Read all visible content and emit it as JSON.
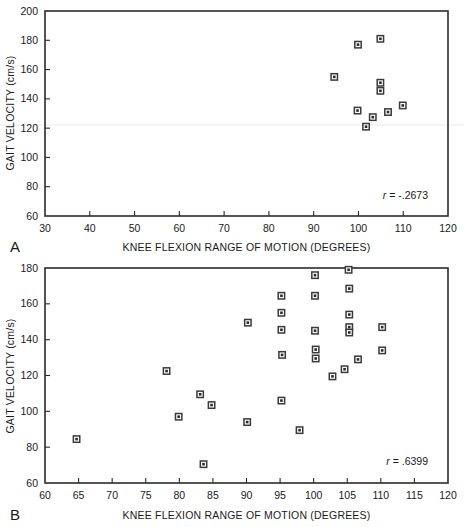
{
  "figure": {
    "caption_letters": {
      "a": "A",
      "b": "B"
    }
  },
  "chart_data": [
    {
      "id": "panel-a",
      "type": "scatter",
      "panel_label": "A",
      "title": "",
      "xlabel": "KNEE FLEXION RANGE OF MOTION (DEGREES)",
      "ylabel": "GAIT VELOCITY (cm/s)",
      "xlim": [
        30,
        120
      ],
      "ylim": [
        60,
        200
      ],
      "xticks": [
        30,
        40,
        50,
        60,
        70,
        80,
        90,
        100,
        110,
        120
      ],
      "yticks": [
        60,
        80,
        100,
        120,
        140,
        160,
        180,
        200
      ],
      "xticklabels": [
        "30",
        "40",
        "50",
        "60",
        "70",
        "80",
        "90",
        "100",
        "110",
        "120"
      ],
      "yticklabels": [
        "60",
        "80",
        "100",
        "120",
        "140",
        "160",
        "180",
        "200"
      ],
      "grid": false,
      "legend": "none",
      "annotation": "r = -.2673",
      "annotation_r_symbol": "r",
      "annotation_r_value": "= -.2673",
      "marker": "square-with-center-dot",
      "points": [
        {
          "x": 94.6,
          "y": 155
        },
        {
          "x": 99.9,
          "y": 177
        },
        {
          "x": 104.9,
          "y": 181
        },
        {
          "x": 99.8,
          "y": 132
        },
        {
          "x": 101.7,
          "y": 121
        },
        {
          "x": 103.2,
          "y": 127.5
        },
        {
          "x": 104.9,
          "y": 151
        },
        {
          "x": 104.9,
          "y": 145.5
        },
        {
          "x": 106.6,
          "y": 131
        },
        {
          "x": 109.9,
          "y": 135.5
        }
      ]
    },
    {
      "id": "panel-b",
      "type": "scatter",
      "panel_label": "B",
      "title": "",
      "xlabel": "KNEE FLEXION RANGE OF MOTION (DEGREES)",
      "ylabel": "GAIT VELOCITY (cm/s)",
      "xlim": [
        60,
        120
      ],
      "ylim": [
        60,
        180
      ],
      "xticks": [
        60,
        65,
        70,
        75,
        80,
        85,
        90,
        95,
        100,
        105,
        110,
        115,
        120
      ],
      "yticks": [
        60,
        80,
        100,
        120,
        140,
        160,
        180
      ],
      "xticklabels": [
        "60",
        "65",
        "70",
        "75",
        "80",
        "85",
        "90",
        "95",
        "100",
        "105",
        "110",
        "115",
        "120"
      ],
      "yticklabels": [
        "60",
        "80",
        "100",
        "120",
        "140",
        "160",
        "180"
      ],
      "grid": false,
      "legend": "none",
      "annotation": "r = .6399",
      "annotation_r_symbol": "r",
      "annotation_r_value": "= .6399",
      "marker": "square-with-center-dot",
      "points": [
        {
          "x": 64.7,
          "y": 84.5
        },
        {
          "x": 78.1,
          "y": 122.5
        },
        {
          "x": 79.9,
          "y": 97
        },
        {
          "x": 83.1,
          "y": 109.5
        },
        {
          "x": 83.6,
          "y": 70.5
        },
        {
          "x": 84.8,
          "y": 103.5
        },
        {
          "x": 90.2,
          "y": 149.5
        },
        {
          "x": 90.1,
          "y": 94
        },
        {
          "x": 95.2,
          "y": 164.5
        },
        {
          "x": 95.2,
          "y": 155
        },
        {
          "x": 95.2,
          "y": 145.5
        },
        {
          "x": 95.3,
          "y": 131.5
        },
        {
          "x": 95.2,
          "y": 106
        },
        {
          "x": 97.9,
          "y": 89.5
        },
        {
          "x": 100.2,
          "y": 176
        },
        {
          "x": 100.2,
          "y": 164.5
        },
        {
          "x": 100.2,
          "y": 145
        },
        {
          "x": 100.3,
          "y": 134.5
        },
        {
          "x": 100.3,
          "y": 129.5
        },
        {
          "x": 102.8,
          "y": 119.5
        },
        {
          "x": 104.6,
          "y": 123.5
        },
        {
          "x": 105.2,
          "y": 179
        },
        {
          "x": 105.3,
          "y": 168.5
        },
        {
          "x": 105.3,
          "y": 154
        },
        {
          "x": 105.3,
          "y": 147
        },
        {
          "x": 105.3,
          "y": 144
        },
        {
          "x": 106.6,
          "y": 129
        },
        {
          "x": 110.2,
          "y": 147
        },
        {
          "x": 110.2,
          "y": 134
        }
      ]
    }
  ]
}
